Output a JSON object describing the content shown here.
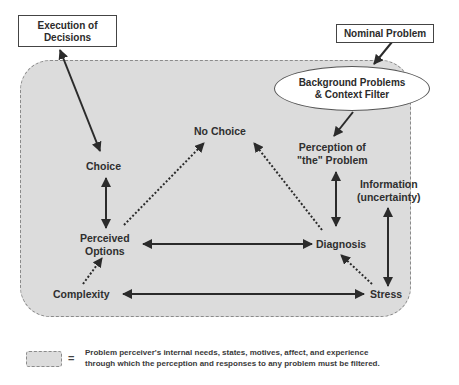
{
  "diagram": {
    "type": "concept-flow",
    "boxes": {
      "execution": {
        "line1": "Execution of",
        "line2": "Decisions"
      },
      "nominal": {
        "label": "Nominal Problem"
      }
    },
    "filter": {
      "line1": "Background Problems",
      "line2": "& Context Filter"
    },
    "nodes": {
      "no_choice": {
        "label": "No Choice"
      },
      "choice": {
        "label": "Choice"
      },
      "perception": {
        "line1": "Perception of",
        "line2": "\"the\" Problem"
      },
      "information": {
        "line1": "Information",
        "line2": "(uncertainty)"
      },
      "perceived_options": {
        "line1": "Perceived",
        "line2": "Options"
      },
      "diagnosis": {
        "label": "Diagnosis"
      },
      "complexity": {
        "label": "Complexity"
      },
      "stress": {
        "label": "Stress"
      }
    },
    "edges": [
      {
        "from": "Execution of Decisions",
        "to": "Choice",
        "style": "solid",
        "direction": "both"
      },
      {
        "from": "Nominal Problem",
        "to": "Background Problems & Context Filter",
        "style": "solid",
        "direction": "forward"
      },
      {
        "from": "Background Problems & Context Filter",
        "to": "Perception of \"the\" Problem",
        "style": "solid",
        "direction": "forward"
      },
      {
        "from": "Choice",
        "to": "Perceived Options",
        "style": "solid",
        "direction": "both"
      },
      {
        "from": "Perceived Options",
        "to": "No Choice",
        "style": "dotted",
        "direction": "forward"
      },
      {
        "from": "Diagnosis",
        "to": "No Choice",
        "style": "dotted",
        "direction": "forward"
      },
      {
        "from": "Perception of \"the\" Problem",
        "to": "Diagnosis",
        "style": "solid",
        "direction": "both"
      },
      {
        "from": "Perceived Options",
        "to": "Diagnosis",
        "style": "solid",
        "direction": "both"
      },
      {
        "from": "Information (uncertainty)",
        "to": "Stress",
        "style": "solid",
        "direction": "both"
      },
      {
        "from": "Complexity",
        "to": "Perceived Options",
        "style": "dotted",
        "direction": "forward"
      },
      {
        "from": "Stress",
        "to": "Diagnosis",
        "style": "dotted",
        "direction": "forward"
      },
      {
        "from": "Complexity",
        "to": "Stress",
        "style": "solid",
        "direction": "both"
      }
    ]
  },
  "legend": {
    "equals": "=",
    "line1": "Problem perceiver's internal needs, states, motives, affect, and experience",
    "line2": "through which the perception and responses to any problem must be filtered."
  },
  "colors": {
    "panel_fill": "#dcdcdc",
    "panel_border": "#8a8a8a",
    "arrow": "#2b2b2b",
    "text": "#2b2b2b"
  }
}
